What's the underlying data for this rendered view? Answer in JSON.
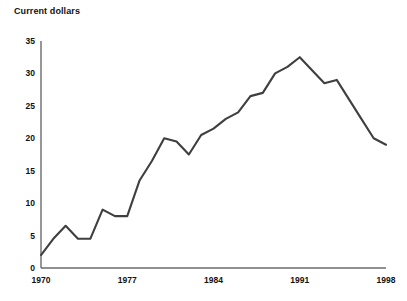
{
  "chart_data": {
    "type": "line",
    "title": "Current dollars",
    "xlabel": "",
    "ylabel": "",
    "xlim": [
      1970,
      1998
    ],
    "ylim": [
      0,
      35
    ],
    "grid": false,
    "legend": null,
    "y_ticks": [
      0,
      5,
      10,
      15,
      20,
      25,
      30,
      35
    ],
    "x_ticks": [
      1970,
      1977,
      1984,
      1991,
      1998
    ],
    "line_color": "#3f3f3f",
    "axis_color": "#6b6b6b",
    "x": [
      1970,
      1971,
      1972,
      1973,
      1974,
      1975,
      1976,
      1977,
      1978,
      1979,
      1980,
      1981,
      1982,
      1983,
      1984,
      1985,
      1986,
      1987,
      1988,
      1989,
      1990,
      1991,
      1992,
      1993,
      1994,
      1995,
      1996,
      1997,
      1998
    ],
    "series": [
      {
        "name": "Current dollars",
        "values": [
          2.0,
          4.5,
          6.5,
          4.5,
          4.5,
          9.0,
          8.0,
          8.0,
          13.5,
          16.5,
          20.0,
          19.5,
          17.5,
          20.5,
          21.5,
          23.0,
          24.0,
          26.5,
          27.0,
          30.0,
          31.0,
          32.5,
          30.5,
          28.5,
          29.0,
          26.0,
          23.0,
          20.0,
          19.0
        ]
      }
    ]
  },
  "notes": {
    "source": ""
  }
}
